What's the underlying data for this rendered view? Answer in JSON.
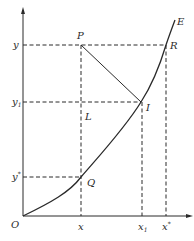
{
  "diagram": {
    "axes": {
      "origin_label": "O",
      "x_ticks": [
        "x",
        "x1",
        "x*"
      ],
      "y_ticks": [
        "y",
        "y1",
        "y*"
      ]
    },
    "points": {
      "P": "P",
      "R": "R",
      "I": "I",
      "L": "L",
      "Q": "Q",
      "E": "E"
    },
    "labels": {
      "y": "y",
      "y1_base": "y",
      "y1_sub": "1",
      "ystar_base": "y",
      "ystar_sup": "*",
      "x": "x",
      "x1_base": "x",
      "x1_sub": "1",
      "xstar_base": "x",
      "xstar_sup": "*"
    },
    "colors": {
      "ink": "#2a2a2a",
      "background": "#ffffff"
    }
  }
}
